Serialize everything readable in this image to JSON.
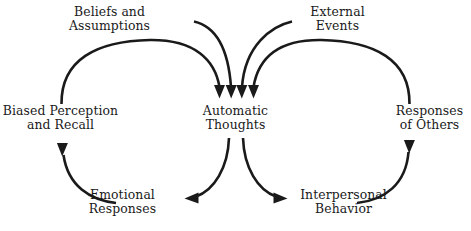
{
  "diagram": {
    "type": "cycle-diagram",
    "stroke_color": "#1a1a1a",
    "text_color": "#1a1a1a",
    "background_color": "#ffffff",
    "nodes": [
      {
        "id": "beliefs",
        "line1": "Beliefs and",
        "line2": "Assumptions"
      },
      {
        "id": "external",
        "line1": "External",
        "line2": "Events"
      },
      {
        "id": "biased",
        "line1": "Biased Perception",
        "line2": "and Recall"
      },
      {
        "id": "automatic",
        "line1": "Automatic",
        "line2": "Thoughts"
      },
      {
        "id": "responses",
        "line1": "Responses",
        "line2": "of Others"
      },
      {
        "id": "emotional",
        "line1": "Emotional",
        "line2": "Responses"
      },
      {
        "id": "interpersonal",
        "line1": "Interpersonal",
        "line2": "Behavior"
      }
    ],
    "edges": [
      {
        "id": "beliefs-to-automatic",
        "from": "beliefs",
        "to": "automatic",
        "direction": "down"
      },
      {
        "id": "external-to-automatic",
        "from": "external",
        "to": "automatic",
        "direction": "down"
      },
      {
        "id": "biased-to-automatic",
        "from": "biased",
        "to": "automatic",
        "direction": "down"
      },
      {
        "id": "responses-to-automatic",
        "from": "responses",
        "to": "automatic",
        "direction": "down"
      },
      {
        "id": "automatic-to-emotional",
        "from": "automatic",
        "to": "emotional",
        "direction": "left"
      },
      {
        "id": "automatic-to-interpersonal",
        "from": "automatic",
        "to": "interpersonal",
        "direction": "right"
      },
      {
        "id": "emotional-to-biased",
        "from": "emotional",
        "to": "biased",
        "direction": "up"
      },
      {
        "id": "interpersonal-to-responses",
        "from": "interpersonal",
        "to": "responses",
        "direction": "up"
      }
    ]
  }
}
